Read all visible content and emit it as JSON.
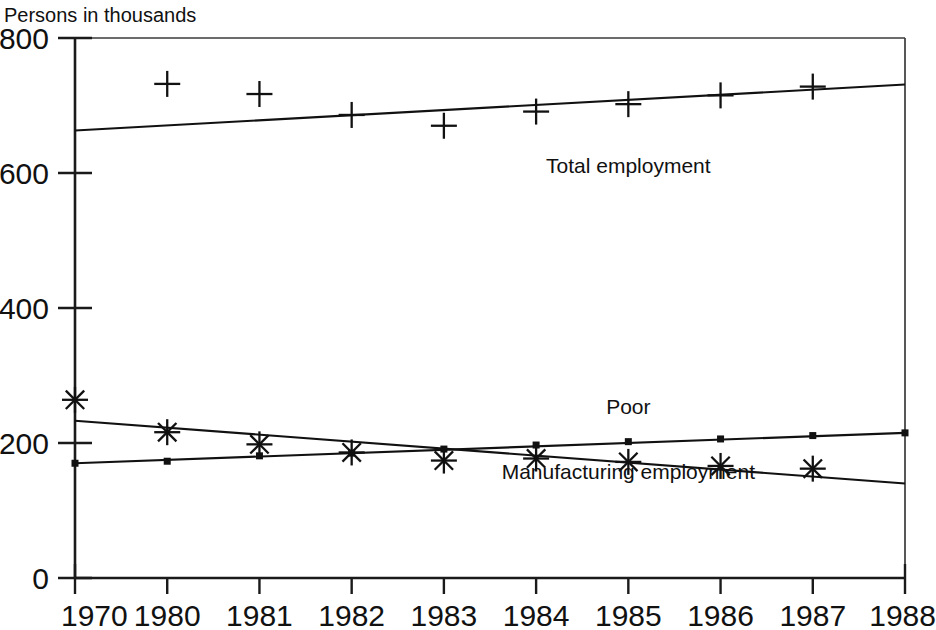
{
  "chart_data": {
    "type": "scatter",
    "title": "",
    "subtitle": "",
    "ylabel": "Persons in thousands",
    "xlabel": "",
    "categories": [
      "1970",
      "1980",
      "1981",
      "1982",
      "1983",
      "1984",
      "1985",
      "1986",
      "1987",
      "1988"
    ],
    "x": [
      1970,
      1980,
      1981,
      1982,
      1983,
      1984,
      1985,
      1986,
      1987,
      1988
    ],
    "ylim": [
      0,
      800
    ],
    "yticks": [
      0,
      200,
      400,
      600,
      800
    ],
    "grid": false,
    "legend_position": "inline-annotations",
    "series": [
      {
        "name": "Total employment",
        "marker": "plus",
        "label_x": 1985,
        "label_y": 600,
        "values": [
          null,
          732,
          717,
          686,
          670,
          691,
          702,
          715,
          728,
          null
        ],
        "trend": {
          "start_x": 1970,
          "start_y": 663,
          "end_x": 1988,
          "end_y": 731
        }
      },
      {
        "name": "Poor",
        "marker": "square",
        "label_x": 1985,
        "label_y": 243,
        "values": [
          170,
          173,
          181,
          185,
          191,
          197,
          202,
          206,
          211,
          215
        ],
        "trend": {
          "start_x": 1970,
          "start_y": 170,
          "end_x": 1988,
          "end_y": 215
        }
      },
      {
        "name": "Manufacturing employment",
        "marker": "asterisk",
        "label_x": 1985,
        "label_y": 146,
        "values": [
          264,
          216,
          198,
          186,
          174,
          177,
          172,
          166,
          162,
          null
        ],
        "trend": {
          "start_x": 1970,
          "start_y": 233,
          "end_x": 1988,
          "end_y": 140
        }
      }
    ]
  },
  "axis": {
    "y_title": "Persons in thousands",
    "y_tick_labels": [
      "800",
      "600",
      "400",
      "200",
      "0"
    ],
    "x_tick_labels": [
      "1970",
      "1980",
      "1981",
      "1982",
      "1983",
      "1984",
      "1985",
      "1986",
      "1987",
      "1988"
    ]
  },
  "annotations": {
    "total_employment": "Total employment",
    "poor": "Poor",
    "manufacturing_employment": "Manufacturing employment"
  },
  "colors": {
    "ink": "#111111",
    "background": "#ffffff"
  }
}
